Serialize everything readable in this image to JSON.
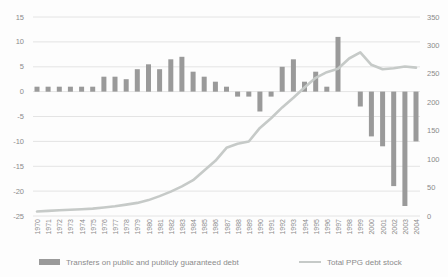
{
  "chart_data": {
    "type": "combo-bar-line",
    "x": [
      1970,
      1971,
      1972,
      1973,
      1974,
      1975,
      1976,
      1977,
      1978,
      1979,
      1980,
      1981,
      1982,
      1983,
      1984,
      1985,
      1986,
      1987,
      1988,
      1989,
      1990,
      1991,
      1992,
      1993,
      1994,
      1995,
      1996,
      1997,
      1998,
      1999,
      2000,
      2001,
      2002,
      2003,
      2004
    ],
    "series": [
      {
        "name": "Transfers on public and publicly guaranteed debt",
        "type": "bar",
        "axis": "left",
        "values": [
          1,
          1,
          1,
          1,
          1,
          1,
          3,
          3,
          2.5,
          4.5,
          5.5,
          4.5,
          6.5,
          7,
          4,
          3,
          2,
          1,
          -1,
          -1,
          -4,
          -1,
          5,
          6.5,
          2,
          4,
          1,
          11,
          0,
          -3,
          -9,
          -11,
          -19,
          -23,
          -10
        ]
      },
      {
        "name": "Total PPG debt stock",
        "type": "line",
        "axis": "right",
        "values": [
          8,
          9,
          10,
          11,
          12,
          13,
          15,
          17,
          20,
          23,
          28,
          35,
          43,
          52,
          63,
          80,
          97,
          120,
          127,
          131,
          155,
          172,
          191,
          208,
          226,
          243,
          253,
          259,
          277,
          288,
          266,
          258,
          260,
          263,
          261
        ]
      }
    ],
    "left_axis": {
      "min": -25,
      "max": 15,
      "tick_step": 5,
      "ticks": [
        15,
        10,
        5,
        0,
        -5,
        -10,
        -15,
        -20,
        -25
      ]
    },
    "right_axis": {
      "min": 0,
      "max": 350,
      "tick_step": 50,
      "ticks": [
        350,
        300,
        250,
        200,
        150,
        100,
        50,
        0
      ]
    },
    "grid": "horizontal",
    "legend_position": "bottom",
    "title": "",
    "xlabel": "",
    "ylabel": ""
  },
  "colors": {
    "bar": "#9a9a9a",
    "line": "#c6cac8",
    "grid": "#e4e4e4",
    "axis_text": "#8b8b8b",
    "background": "#fdfdfd"
  }
}
